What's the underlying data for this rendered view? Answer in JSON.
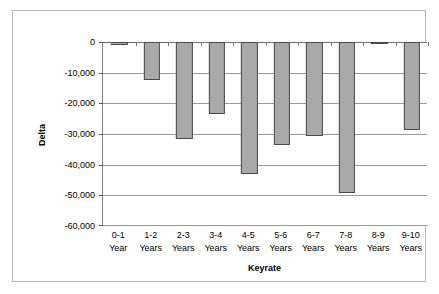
{
  "chart_data": {
    "type": "bar",
    "title": "",
    "xlabel": "Keyrate",
    "ylabel": "Delta",
    "categories": [
      "0-1 Year",
      "1-2 Years",
      "2-3 Years",
      "3-4 Years",
      "4-5 Years",
      "5-6 Years",
      "6-7 Years",
      "7-8 Years",
      "8-9 Years",
      "9-10 Years"
    ],
    "category_lines": [
      [
        "0-1",
        "Year"
      ],
      [
        "1-2",
        "Years"
      ],
      [
        "2-3",
        "Years"
      ],
      [
        "3-4",
        "Years"
      ],
      [
        "4-5",
        "Years"
      ],
      [
        "5-6",
        "Years"
      ],
      [
        "6-7",
        "Years"
      ],
      [
        "7-8",
        "Years"
      ],
      [
        "8-9",
        "Years"
      ],
      [
        "9-10",
        "Years"
      ]
    ],
    "values": [
      -1100,
      -12500,
      -31700,
      -23600,
      -43200,
      -33500,
      -30600,
      -49200,
      -800,
      -28600
    ],
    "ylim": [
      -60000,
      0
    ],
    "ytick_values": [
      0,
      -10000,
      -20000,
      -30000,
      -40000,
      -50000,
      -60000
    ],
    "ytick_labels": [
      "0",
      "-10,000",
      "-20,000",
      "-30,000",
      "-40,000",
      "-50,000",
      "-60,000"
    ],
    "grid": true,
    "legend": false,
    "series_color": "#a9a9a9",
    "series_border_color": "#4a4a4a",
    "gridline_color": "#9a9a9a",
    "frame_color": "#b9b9b9",
    "background": "#ffffff"
  }
}
